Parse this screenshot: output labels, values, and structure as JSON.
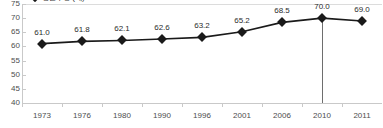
{
  "chart_data": {
    "type": "line",
    "title": "",
    "legend": {
      "entries": [
        "평균수명 (세)"
      ],
      "position": "top-left",
      "clipped": true
    },
    "categories": [
      "1973",
      "1976",
      "1980",
      "1990",
      "1996",
      "2001",
      "2006",
      "2010",
      "2011"
    ],
    "values": [
      61.0,
      61.8,
      62.1,
      62.6,
      63.2,
      65.2,
      68.5,
      70.0,
      69.0
    ],
    "data_labels": [
      "61.0",
      "61.8",
      "62.1",
      "62.6",
      "63.2",
      "65.2",
      "68.5",
      "70.0",
      "69.0"
    ],
    "xlabel": "",
    "ylabel": "",
    "ylim": [
      40,
      75
    ],
    "yticks": [
      75,
      70,
      65,
      60,
      55,
      50,
      45,
      40
    ],
    "ytick_labels": [
      "75",
      "70",
      "65",
      "60",
      "55",
      "50",
      "45",
      "40"
    ],
    "grid": false,
    "annotations": [
      {
        "name": "drop-line-2010",
        "category": "2010",
        "from_value": 70.0,
        "to_value": 40
      }
    ],
    "colors": {
      "series_line": "#1a1a1a",
      "marker": "#1a1a1a",
      "axis": "#c9c9c9",
      "tick_text": "#4d4d4d",
      "data_label_text": "#2b2b2b",
      "drop_line": "#6e6e6e",
      "background": "#ffffff"
    }
  }
}
